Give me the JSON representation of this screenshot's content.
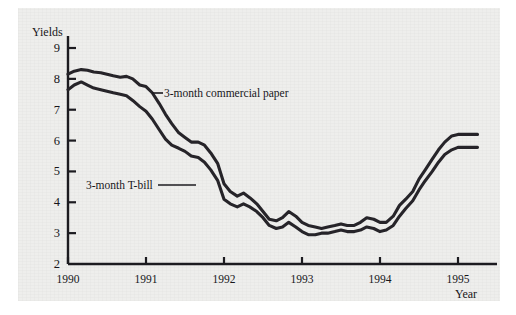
{
  "figure": {
    "background_color": "#eeeeec",
    "ink_color": "#262429",
    "axis_color": "#1c1b20"
  },
  "axes": {
    "y_title": "Yields",
    "x_title": "Year",
    "y_ticks": [
      "9",
      "8",
      "7",
      "6",
      "5",
      "4",
      "3",
      "2"
    ],
    "x_ticks": [
      "1990",
      "1991",
      "1992",
      "1993",
      "1994",
      "1995"
    ]
  },
  "annotations": [
    {
      "id": "commercial-paper",
      "label": "3-month commercial paper"
    },
    {
      "id": "t-bill",
      "label": "3-month T-bill"
    }
  ],
  "chart_data": {
    "type": "line",
    "title": "",
    "xlabel": "Year",
    "ylabel": "Yields",
    "xlim": [
      1990.0,
      1995.25
    ],
    "ylim": [
      2,
      9
    ],
    "grid": false,
    "legend": "inline-annotations",
    "x": [
      1990.0,
      1990.08,
      1990.17,
      1990.25,
      1990.33,
      1990.42,
      1990.5,
      1990.58,
      1990.67,
      1990.75,
      1990.83,
      1990.92,
      1991.0,
      1991.08,
      1991.17,
      1991.25,
      1991.33,
      1991.42,
      1991.5,
      1991.58,
      1991.67,
      1991.75,
      1991.83,
      1991.92,
      1992.0,
      1992.08,
      1992.17,
      1992.25,
      1992.33,
      1992.42,
      1992.5,
      1992.58,
      1992.67,
      1992.75,
      1992.83,
      1992.92,
      1993.0,
      1993.08,
      1993.17,
      1993.25,
      1993.33,
      1993.42,
      1993.5,
      1993.58,
      1993.67,
      1993.75,
      1993.83,
      1993.92,
      1994.0,
      1994.08,
      1994.17,
      1994.25,
      1994.33,
      1994.42,
      1994.5,
      1994.58,
      1994.67,
      1994.75,
      1994.83,
      1994.92,
      1995.0,
      1995.08,
      1995.17,
      1995.25
    ],
    "series": [
      {
        "name": "3-month commercial paper",
        "color": "#262429",
        "values": [
          8.15,
          8.25,
          8.3,
          8.28,
          8.22,
          8.2,
          8.15,
          8.1,
          8.05,
          8.08,
          8.0,
          7.8,
          7.75,
          7.55,
          7.2,
          6.85,
          6.55,
          6.25,
          6.1,
          5.95,
          5.95,
          5.85,
          5.6,
          5.25,
          4.6,
          4.35,
          4.2,
          4.3,
          4.15,
          3.95,
          3.7,
          3.45,
          3.4,
          3.5,
          3.7,
          3.55,
          3.35,
          3.25,
          3.2,
          3.15,
          3.2,
          3.25,
          3.3,
          3.25,
          3.25,
          3.35,
          3.5,
          3.45,
          3.35,
          3.35,
          3.55,
          3.9,
          4.1,
          4.35,
          4.75,
          5.05,
          5.4,
          5.7,
          5.95,
          6.15,
          6.2,
          6.2,
          6.2,
          6.2
        ]
      },
      {
        "name": "3-month T-bill",
        "color": "#262429",
        "values": [
          7.65,
          7.8,
          7.9,
          7.8,
          7.7,
          7.65,
          7.6,
          7.55,
          7.5,
          7.45,
          7.3,
          7.1,
          6.95,
          6.7,
          6.35,
          6.05,
          5.85,
          5.75,
          5.65,
          5.5,
          5.45,
          5.3,
          5.05,
          4.7,
          4.1,
          3.95,
          3.85,
          3.95,
          3.85,
          3.7,
          3.5,
          3.25,
          3.15,
          3.2,
          3.35,
          3.2,
          3.05,
          2.95,
          2.95,
          3.0,
          3.0,
          3.05,
          3.1,
          3.05,
          3.05,
          3.1,
          3.2,
          3.15,
          3.05,
          3.1,
          3.25,
          3.55,
          3.8,
          4.05,
          4.4,
          4.7,
          5.0,
          5.3,
          5.55,
          5.7,
          5.78,
          5.78,
          5.78,
          5.78
        ]
      }
    ]
  }
}
